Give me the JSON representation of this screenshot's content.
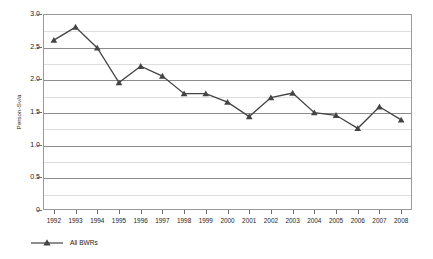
{
  "chart_data": {
    "type": "line",
    "title": "",
    "subtitle": "",
    "xlabel": "",
    "ylabel": "Person-Sv/a",
    "categories": [
      "1992",
      "1993",
      "1994",
      "1995",
      "1996",
      "1997",
      "1998",
      "1999",
      "2000",
      "2001",
      "2002",
      "2003",
      "2004",
      "2005",
      "2006",
      "2007",
      "2008"
    ],
    "series": [
      {
        "name": "All BWRs",
        "color": "#444444",
        "marker": "triangle",
        "values": [
          2.6,
          2.8,
          2.48,
          1.95,
          2.2,
          2.05,
          1.78,
          1.78,
          1.65,
          1.43,
          1.72,
          1.79,
          1.49,
          1.45,
          1.25,
          1.58,
          1.38
        ]
      }
    ],
    "ylim": [
      0,
      3.0
    ],
    "ytick_values": [
      0,
      0.5,
      1.0,
      1.5,
      2.0,
      2.5,
      3.0
    ],
    "ytick_labels": [
      "0",
      "0.5",
      "1.0",
      "1.5",
      "2.0",
      "2.5",
      "3.0"
    ],
    "minor_ytick_values": [
      0.25,
      0.75,
      1.25,
      1.75,
      2.25,
      2.75
    ],
    "grid": true,
    "grid_axis": "y",
    "legend_position": "bottom-left",
    "legend_entries": [
      "All BWRs"
    ]
  },
  "axis": {
    "y_title": "Person-Sv/a"
  },
  "legend": {
    "items": [
      {
        "label": "All BWRs"
      }
    ]
  }
}
